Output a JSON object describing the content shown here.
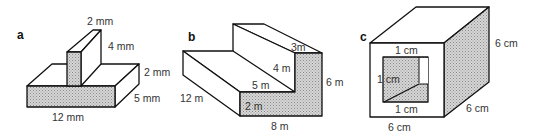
{
  "figures": [
    {
      "panel": "a",
      "labels": {
        "top_width": "2 mm",
        "height": "4 mm",
        "base_height": "2 mm",
        "depth": "5 mm",
        "length": "12 mm"
      }
    },
    {
      "panel": "b",
      "labels": {
        "top_step": "3m",
        "step_rise": "4 m",
        "tread": "5 m",
        "total_height": "6 m",
        "depth": "12 m",
        "bottom_rise": "2 m",
        "length": "8 m"
      }
    },
    {
      "panel": "c",
      "labels": {
        "hole_top": "1 cm",
        "hole_side": "1 cm",
        "hole_bottom": "1 cm",
        "height": "6 cm",
        "depth": "6 cm",
        "width": "6 cm"
      }
    }
  ],
  "colors": {
    "line": "#111111",
    "shade": "#b8b8b8",
    "text": "#333333"
  }
}
